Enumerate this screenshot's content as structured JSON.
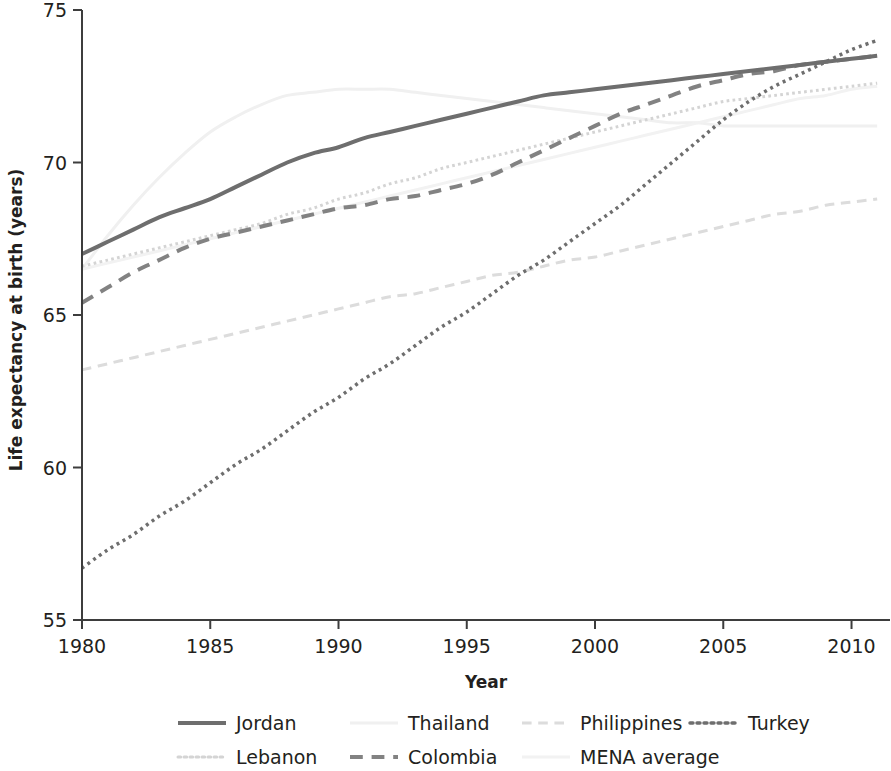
{
  "chart_data": {
    "type": "line",
    "title": "",
    "xlabel": "Year",
    "ylabel": "Life expectancy at birth (years)",
    "xlim": [
      1980,
      2011.5
    ],
    "ylim": [
      55,
      75
    ],
    "xticks": [
      "1980",
      "1985",
      "1990",
      "1995",
      "2000",
      "2005",
      "2010"
    ],
    "xtick_values": [
      1980,
      1985,
      1990,
      1995,
      2000,
      2005,
      2010
    ],
    "yticks": [
      "55",
      "60",
      "65",
      "70",
      "75"
    ],
    "ytick_values": [
      55,
      60,
      65,
      70,
      75
    ],
    "grid": false,
    "legend_position": "bottom",
    "x": [
      1980,
      1981,
      1982,
      1983,
      1984,
      1985,
      1986,
      1987,
      1988,
      1989,
      1990,
      1991,
      1992,
      1993,
      1994,
      1995,
      1996,
      1997,
      1998,
      1999,
      2000,
      2001,
      2002,
      2003,
      2004,
      2005,
      2006,
      2007,
      2008,
      2009,
      2010,
      2011
    ],
    "series": [
      {
        "name": "Jordan",
        "color": "#6e6e6e",
        "style": "solid",
        "width": 4,
        "values": [
          67.0,
          67.4,
          67.8,
          68.2,
          68.5,
          68.8,
          69.2,
          69.6,
          70.0,
          70.3,
          70.5,
          70.8,
          71.0,
          71.2,
          71.4,
          71.6,
          71.8,
          72.0,
          72.2,
          72.3,
          72.4,
          72.5,
          72.6,
          72.7,
          72.8,
          72.9,
          73.0,
          73.1,
          73.2,
          73.3,
          73.4,
          73.5
        ]
      },
      {
        "name": "Lebanon",
        "color": "#d4d4d4",
        "style": "dotted",
        "width": 3,
        "values": [
          66.6,
          66.8,
          67.0,
          67.2,
          67.4,
          67.6,
          67.8,
          68.0,
          68.3,
          68.5,
          68.8,
          69.0,
          69.3,
          69.5,
          69.8,
          70.0,
          70.2,
          70.4,
          70.6,
          70.8,
          71.0,
          71.2,
          71.4,
          71.6,
          71.8,
          72.0,
          72.1,
          72.2,
          72.3,
          72.4,
          72.5,
          72.6
        ]
      },
      {
        "name": "Thailand",
        "color": "#f0f0f0",
        "style": "solid",
        "width": 3,
        "values": [
          66.5,
          67.6,
          68.6,
          69.5,
          70.3,
          71.0,
          71.5,
          71.9,
          72.2,
          72.3,
          72.4,
          72.4,
          72.4,
          72.3,
          72.2,
          72.1,
          72.0,
          71.9,
          71.8,
          71.7,
          71.6,
          71.5,
          71.4,
          71.3,
          71.3,
          71.2,
          71.2,
          71.2,
          71.2,
          71.2,
          71.2,
          71.2
        ]
      },
      {
        "name": "Colombia",
        "color": "#828282",
        "style": "dashed",
        "width": 4,
        "values": [
          65.4,
          65.9,
          66.4,
          66.8,
          67.2,
          67.5,
          67.7,
          67.9,
          68.1,
          68.3,
          68.5,
          68.6,
          68.8,
          68.9,
          69.1,
          69.3,
          69.6,
          70.0,
          70.4,
          70.8,
          71.2,
          71.6,
          71.9,
          72.2,
          72.5,
          72.7,
          72.9,
          73.0,
          73.2,
          73.3,
          73.4,
          73.5
        ]
      },
      {
        "name": "Philippines",
        "color": "#dcdcdc",
        "style": "dashed",
        "width": 3,
        "values": [
          63.2,
          63.4,
          63.6,
          63.8,
          64.0,
          64.2,
          64.4,
          64.6,
          64.8,
          65.0,
          65.2,
          65.4,
          65.6,
          65.7,
          65.9,
          66.1,
          66.3,
          66.4,
          66.6,
          66.8,
          66.9,
          67.1,
          67.3,
          67.5,
          67.7,
          67.9,
          68.1,
          68.3,
          68.4,
          68.6,
          68.7,
          68.8
        ]
      },
      {
        "name": "MENA average",
        "color": "#f2f2f2",
        "style": "solid",
        "width": 3,
        "values": [
          66.5,
          66.7,
          66.9,
          67.1,
          67.3,
          67.5,
          67.7,
          67.9,
          68.1,
          68.3,
          68.5,
          68.7,
          68.9,
          69.1,
          69.3,
          69.5,
          69.7,
          69.9,
          70.1,
          70.3,
          70.5,
          70.7,
          70.9,
          71.1,
          71.3,
          71.5,
          71.7,
          71.9,
          72.1,
          72.2,
          72.4,
          72.5
        ]
      },
      {
        "name": "Turkey",
        "color": "#6e6e6e",
        "style": "fine-dotted",
        "width": 3.5,
        "values": [
          56.7,
          57.3,
          57.8,
          58.4,
          58.9,
          59.5,
          60.1,
          60.6,
          61.2,
          61.8,
          62.3,
          62.9,
          63.4,
          64.0,
          64.6,
          65.1,
          65.7,
          66.3,
          66.8,
          67.4,
          68.0,
          68.6,
          69.3,
          70.0,
          70.7,
          71.4,
          72.0,
          72.5,
          72.9,
          73.3,
          73.7,
          74.0
        ]
      }
    ]
  },
  "legend": {
    "rows": [
      [
        {
          "label": "Jordan",
          "key": "Jordan"
        },
        {
          "label": "Thailand",
          "key": "Thailand"
        },
        {
          "label": "Philippines",
          "key": "Philippines"
        },
        {
          "label": "Turkey",
          "key": "Turkey"
        }
      ],
      [
        {
          "label": "Lebanon",
          "key": "Lebanon"
        },
        {
          "label": "Colombia",
          "key": "Colombia"
        },
        {
          "label": "MENA average",
          "key": "MENA average"
        }
      ]
    ]
  }
}
